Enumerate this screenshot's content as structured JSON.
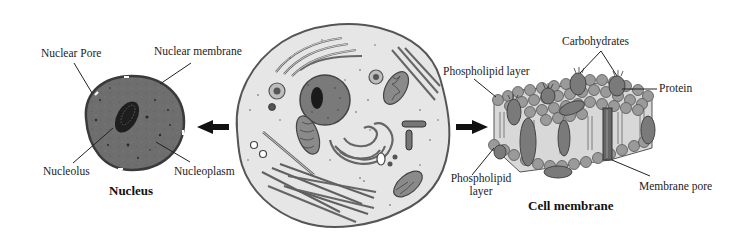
{
  "diagram": {
    "nucleus": {
      "title": "Nucleus",
      "labels": {
        "nuclear_pore": "Nuclear Pore",
        "nuclear_membrane": "Nuclear membrane",
        "nucleolus": "Nucleolus",
        "nucleoplasm": "Nucleoplasm"
      }
    },
    "cell": {
      "description": "Animal cell with organelles"
    },
    "cell_membrane": {
      "title": "Cell membrane",
      "labels": {
        "carbohydrates": "Carbohydrates",
        "phospholipid_layer_top": "Phospholipid layer",
        "protein": "Protein",
        "phospholipid_layer_bottom_line1": "Phospholipid",
        "phospholipid_layer_bottom_line2": "layer",
        "membrane_pore": "Membrane pore"
      }
    },
    "arrows": {
      "left": "arrow-left",
      "right": "arrow-right"
    },
    "colors": {
      "nucleus_fill": "#6e6e6e",
      "nucleus_outline": "#3a3a3a",
      "nucleolus_fill": "#1e1e1e",
      "cytoplasm_fill": "#e6e6e6",
      "cell_outline": "#555555",
      "organelle_fill": "#8a8a8a",
      "bead_fill": "#9a9a9a",
      "membrane_body": "#d8d8d8",
      "text": "#222222"
    }
  }
}
